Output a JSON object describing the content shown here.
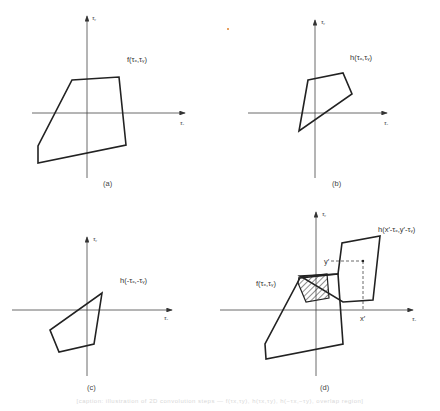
{
  "figure": {
    "caption": "[caption: illustration of 2D convolution steps — f(τx,τy), h(τx,τy), h(−τx,−τy), overlap region]",
    "panels": [
      {
        "id": "a",
        "label": "(a)",
        "function_label": "f(τₓ,τᵧ)",
        "x_axis": "τₓ",
        "y_axis": "τᵧ"
      },
      {
        "id": "b",
        "label": "(b)",
        "function_label": "h(τₓ,τᵧ)",
        "x_axis": "τₓ",
        "y_axis": "τᵧ"
      },
      {
        "id": "c",
        "label": "(c)",
        "function_label": "h(-τₓ,-τᵧ)",
        "x_axis": "τₓ",
        "y_axis": "τᵧ"
      },
      {
        "id": "d",
        "label": "(d)",
        "function_label_f": "f(τₓ,τᵧ)",
        "function_label_h": "h(x′-τₓ,y′-τᵧ)",
        "x_axis": "τₓ",
        "y_axis": "τᵧ",
        "x_marker": "x′",
        "y_marker": "y′"
      }
    ],
    "colors": {
      "stroke": "#222222",
      "axis": "#444444",
      "hatch": "#333333"
    }
  }
}
